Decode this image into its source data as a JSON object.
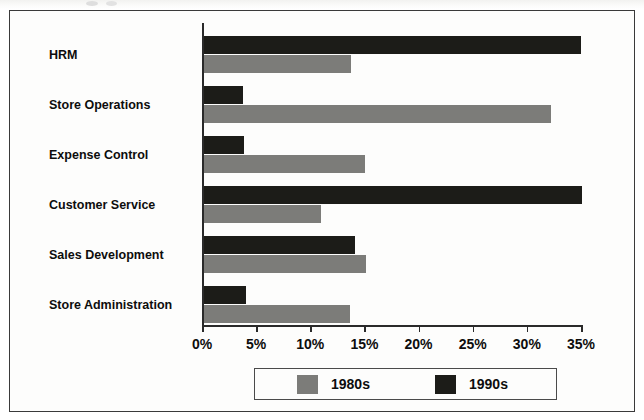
{
  "chart_data": {
    "type": "bar",
    "orientation": "horizontal",
    "title": "",
    "xlabel": "",
    "ylabel": "",
    "xlim": [
      0,
      35
    ],
    "xtick_labels": [
      "0%",
      "5%",
      "10%",
      "15%",
      "20%",
      "25%",
      "30%",
      "35%"
    ],
    "xtick_values": [
      0,
      5,
      10,
      15,
      20,
      25,
      30,
      35
    ],
    "grid": false,
    "legend_position": "bottom-center",
    "categories": [
      "HRM",
      "Store Operations",
      "Expense Control",
      "Customer Service",
      "Sales Development",
      "Store Administration"
    ],
    "series": [
      {
        "name": "1980s",
        "color": "#7c7c79",
        "values": [
          13.6,
          32.0,
          14.9,
          10.8,
          15.0,
          13.5
        ]
      },
      {
        "name": "1990s",
        "color": "#1c1c18",
        "values": [
          34.8,
          3.6,
          3.7,
          34.9,
          13.9,
          3.9
        ]
      }
    ]
  },
  "legend": {
    "entries": [
      {
        "label": "1980s",
        "color": "#7c7c79"
      },
      {
        "label": "1990s",
        "color": "#1c1c18"
      }
    ]
  },
  "colors": {
    "series_1980s": "#7c7c79",
    "series_1990s": "#1c1c18",
    "axis": "#2a2a2a",
    "frame": "#3a3a3a",
    "background": "#fdfdfc"
  }
}
